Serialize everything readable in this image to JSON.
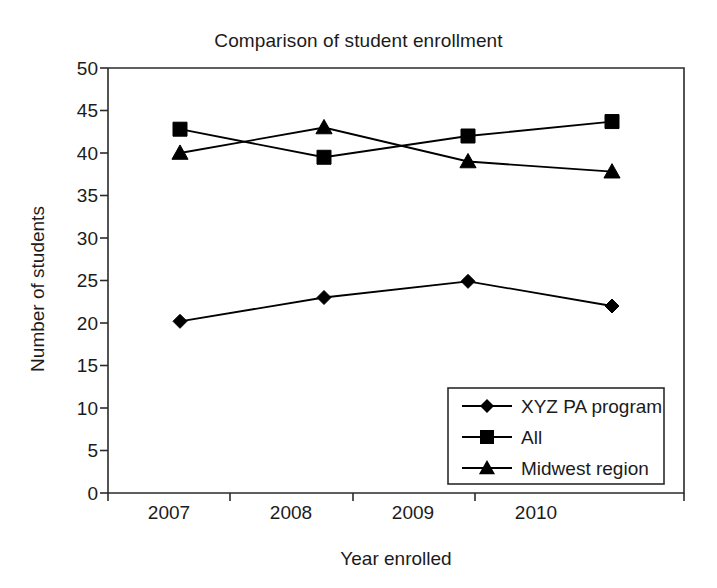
{
  "chart_data": {
    "type": "line",
    "title": "Comparison of student enrollment",
    "xlabel": "Year enrolled",
    "ylabel": "Number of students",
    "categories": [
      "2007",
      "2008",
      "2009",
      "2010"
    ],
    "ylim": [
      0,
      50
    ],
    "yticks": [
      "0",
      "5",
      "10",
      "15",
      "20",
      "25",
      "30",
      "35",
      "40",
      "45",
      "50"
    ],
    "grid": false,
    "legend_position": "lower-right-inside",
    "series": [
      {
        "name": "XYZ PA program",
        "marker": "diamond",
        "color": "#000000",
        "values": [
          20.2,
          23.0,
          24.9,
          22.0
        ]
      },
      {
        "name": "All",
        "marker": "square",
        "color": "#000000",
        "values": [
          42.8,
          39.5,
          42.0,
          43.7
        ]
      },
      {
        "name": "Midwest region",
        "marker": "triangle",
        "color": "#000000",
        "values": [
          40.0,
          43.0,
          39.0,
          37.8
        ]
      }
    ]
  },
  "legend": {
    "items": [
      {
        "label": "XYZ PA program",
        "marker": "diamond-marker-icon"
      },
      {
        "label": "All",
        "marker": "square-marker-icon"
      },
      {
        "label": "Midwest region",
        "marker": "triangle-marker-icon"
      }
    ]
  },
  "axis": {
    "y_ticks": [
      "50",
      "45",
      "40",
      "35",
      "30",
      "25",
      "20",
      "15",
      "10",
      "5",
      "0"
    ],
    "x_ticks": [
      "2007",
      "2008",
      "2009",
      "2010"
    ]
  }
}
